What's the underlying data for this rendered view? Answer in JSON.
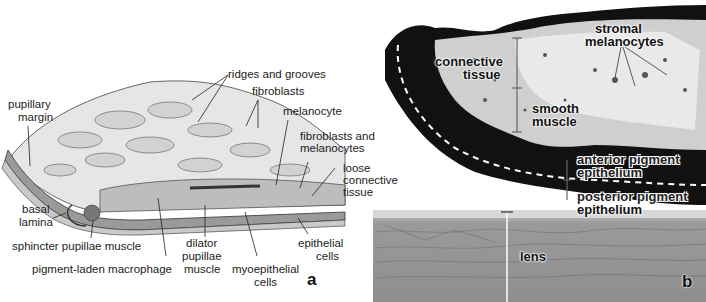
{
  "figure": {
    "panel_a": {
      "letter": "a",
      "labels": {
        "ridges_and_grooves": "ridges and grooves",
        "fibroblasts": "fibroblasts",
        "pupillary_margin_1": "pupillary",
        "pupillary_margin_2": "margin",
        "melanocyte": "melanocyte",
        "fibroblasts_and_melanocytes_1": "fibroblasts and",
        "fibroblasts_and_melanocytes_2": "melanocytes",
        "loose_connective_tissue_1": "loose",
        "loose_connective_tissue_2": "connective",
        "loose_connective_tissue_3": "tissue",
        "basal_lamina_1": "basal",
        "basal_lamina_2": "lamina",
        "sphincter_pupillae_muscle": "sphincter pupillae muscle",
        "pigment_laden_macrophage": "pigment-laden macrophage",
        "dilator_pupillae_muscle_1": "dilator",
        "dilator_pupillae_muscle_2": "pupillae",
        "dilator_pupillae_muscle_3": "muscle",
        "myoepithelial_cells_1": "myoepithelial",
        "myoepithelial_cells_2": "cells",
        "epithelial_cells_1": "epithelial",
        "epithelial_cells_2": "cells"
      }
    },
    "panel_b": {
      "letter": "b",
      "labels": {
        "stromal_melanocytes_1": "stromal",
        "stromal_melanocytes_2": "melanocytes",
        "connective_tissue_1": "connective",
        "connective_tissue_2": "tissue",
        "smooth_muscle_1": "smooth",
        "smooth_muscle_2": "muscle",
        "anterior_pigment_epithelium_1": "anterior pigment",
        "anterior_pigment_epithelium_2": "epithelium",
        "posterior_pigment_epithelium_1": "posterior pigment",
        "posterior_pigment_epithelium_2": "epithelium",
        "lens": "lens"
      }
    }
  }
}
